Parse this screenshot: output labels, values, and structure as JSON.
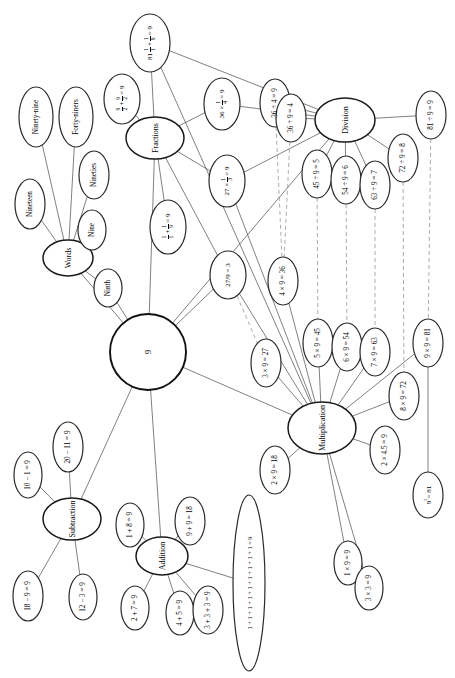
{
  "diagram": {
    "center": {
      "label": "9"
    },
    "branches": [
      {
        "id": "words",
        "label": "Words"
      },
      {
        "id": "fractions",
        "label": "Fractions"
      },
      {
        "id": "division",
        "label": "Division"
      },
      {
        "id": "multiplication",
        "label": "Multiplication"
      },
      {
        "id": "addition",
        "label": "Addition"
      },
      {
        "id": "subtraction",
        "label": "Subtraction"
      }
    ],
    "words": {
      "items": [
        {
          "label": "Ninety-nine"
        },
        {
          "label": "Forty-niners"
        },
        {
          "label": "Nineties"
        },
        {
          "label": "Nineteen"
        },
        {
          "label": "Nine"
        },
        {
          "label": "Ninth"
        }
      ]
    },
    "fractions": {
      "items": [
        {
          "label": "81/1 + 1/9 = 9",
          "parts": [
            {
              "t": "81"
            },
            {
              "f": [
                "1",
                "1"
              ]
            },
            {
              "t": "+"
            },
            {
              "f": [
                "1",
                "9"
              ]
            },
            {
              "t": "= 9"
            }
          ]
        },
        {
          "label": "9/2 + 9/2 = 9",
          "parts": [
            {
              "f": [
                "9",
                "2"
              ]
            },
            {
              "t": "+"
            },
            {
              "f": [
                "9",
                "2"
              ]
            },
            {
              "t": "= 9"
            }
          ]
        },
        {
          "label": "36 x 1/4 = 9",
          "parts": [
            {
              "t": "36 ×"
            },
            {
              "f": [
                "1",
                "4"
              ]
            },
            {
              "t": "= 9"
            }
          ]
        },
        {
          "label": "27 x 1/3 = 9",
          "parts": [
            {
              "t": "27 ×"
            },
            {
              "f": [
                "1",
                "3"
              ]
            },
            {
              "t": "= 9"
            }
          ]
        },
        {
          "label": "1/1 + 1/9 = 9",
          "parts": [
            {
              "f": [
                "1",
                "1"
              ]
            },
            {
              "t": "+"
            },
            {
              "f": [
                "1",
                "9"
              ]
            },
            {
              "t": "= 9"
            }
          ]
        },
        {
          "label": "27/9 = 3",
          "parts": [
            {
              "t": "27/9 = 3"
            }
          ]
        }
      ]
    },
    "division": {
      "items": [
        {
          "label": "36 ÷ 4 = 9"
        },
        {
          "label": "36 ÷ 9 = 4"
        },
        {
          "label": "45 ÷ 9 = 5"
        },
        {
          "label": "54 ÷ 9 = 6"
        },
        {
          "label": "63 ÷ 9 = 7"
        },
        {
          "label": "72 ÷ 9 = 8"
        },
        {
          "label": "81 ÷ 9 = 9"
        }
      ]
    },
    "multiplication": {
      "items": [
        {
          "label": "4 × 9 = 36"
        },
        {
          "label": "3 × 9 = 27"
        },
        {
          "label": "5 × 9 = 45"
        },
        {
          "label": "6 × 9 = 54"
        },
        {
          "label": "7 × 9 = 63"
        },
        {
          "label": "9 × 9 = 81"
        },
        {
          "label": "8 × 9 = 72"
        },
        {
          "label": "2 × 4.5 = 9"
        },
        {
          "label": "2 × 9 = 18"
        },
        {
          "label": "1 × 9 = 9"
        },
        {
          "label": "3 × 3 = 9"
        },
        {
          "label": "9² = 81",
          "parts": [
            {
              "t": "9"
            },
            {
              "sup": "2"
            },
            {
              "t": "= 81"
            }
          ]
        }
      ]
    },
    "addition": {
      "items": [
        {
          "label": "1 + 8 = 9"
        },
        {
          "label": "9 + 9 = 18"
        },
        {
          "label": "2 + 7 = 9"
        },
        {
          "label": "4 + 5 = 9"
        },
        {
          "label": "3 + 3 + 3 = 9"
        },
        {
          "label": "1 + 1 + 1 + 1 + 1 + 1 + 1 + 1 + 1 = 9"
        }
      ]
    },
    "subtraction": {
      "items": [
        {
          "label": "10 − 1 = 9"
        },
        {
          "label": "20 − 11 = 9"
        },
        {
          "label": "18 − 9 = 9"
        },
        {
          "label": "12 − 3 = 9"
        }
      ]
    },
    "colors": {
      "node_stroke": "#1a1a1a",
      "edge": "#4a4a4a",
      "edge_dashed": "#8a8a8a",
      "background": "#ffffff"
    }
  }
}
